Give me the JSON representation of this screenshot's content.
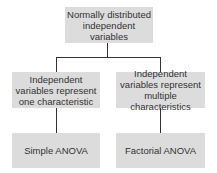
{
  "diagram": {
    "root": {
      "line1": "Normally distributed",
      "line2": "independent variables"
    },
    "left": {
      "line1": "Independent",
      "line2": "variables represent",
      "line3": "one characteristic"
    },
    "right": {
      "line1": "Independent",
      "line2": "variables represent",
      "line3": "multiple characteristics"
    },
    "left_result": "Simple ANOVA",
    "right_result": "Factorial ANOVA",
    "colors": {
      "box_fill": "#dcdcdc",
      "line": "#333333",
      "text": "#333333"
    }
  }
}
